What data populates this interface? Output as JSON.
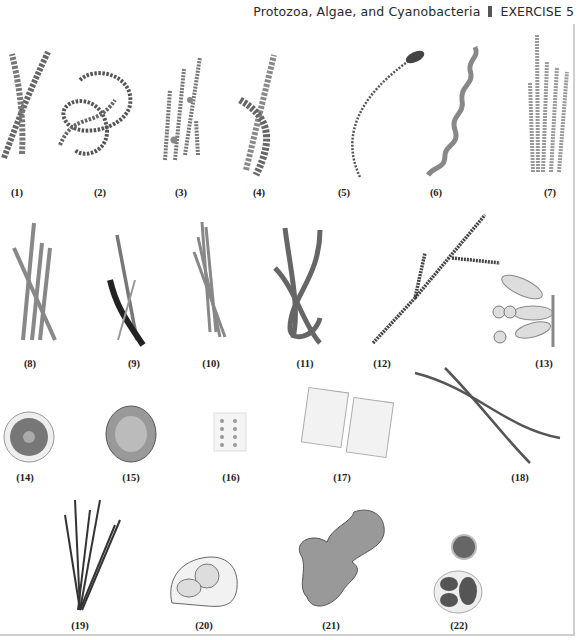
{
  "header": {
    "chapter_title": "Protozoa, Algae, and Cyanobacteria",
    "separator": "▮",
    "exercise": "EXERCISE 5"
  },
  "figures": [
    {
      "label": "(1)"
    },
    {
      "label": "(2)"
    },
    {
      "label": "(3)"
    },
    {
      "label": "(4)"
    },
    {
      "label": "(5)"
    },
    {
      "label": "(6)"
    },
    {
      "label": "(7)"
    },
    {
      "label": "(8)"
    },
    {
      "label": "(9)"
    },
    {
      "label": "(10)"
    },
    {
      "label": "(11)"
    },
    {
      "label": "(12)"
    },
    {
      "label": "(13)"
    },
    {
      "label": "(14)"
    },
    {
      "label": "(15)"
    },
    {
      "label": "(16)"
    },
    {
      "label": "(17)"
    },
    {
      "label": "(18)"
    },
    {
      "label": "(19)"
    },
    {
      "label": "(20)"
    },
    {
      "label": "(21)"
    },
    {
      "label": "(22)"
    }
  ],
  "colors": {
    "ink": "#3a3a3a",
    "fill": "#d8d8d8",
    "dark": "#555555",
    "frame": "#cfcfcf"
  }
}
